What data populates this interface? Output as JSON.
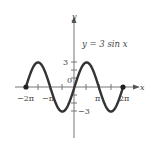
{
  "chart_data": {
    "type": "line",
    "title": "y = 3 sin x",
    "function": "3*sin(x)",
    "series": [
      {
        "name": "y = 3 sin x",
        "x": [
          "-2π",
          "-3π/2",
          "-π",
          "-π/2",
          "0",
          "π/2",
          "π",
          "3π/2",
          "2π"
        ],
        "values": [
          0,
          3,
          0,
          -3,
          0,
          3,
          0,
          -3,
          0
        ]
      }
    ],
    "xlabel": "x",
    "ylabel": "y",
    "x_tick_labels": [
      "-2π",
      "-π",
      "π",
      "2π"
    ],
    "y_tick_labels": [
      "3",
      "-3"
    ],
    "origin_label": "0",
    "xlim": [
      "-2π",
      "2π"
    ],
    "ylim": [
      -3,
      3
    ],
    "endpoints": [
      "(-2π, 0)",
      "(2π, 0)"
    ],
    "grid": false,
    "legend": "none"
  },
  "labels": {
    "equation": "y = 3 sin x",
    "x_axis": "x",
    "y_axis": "y",
    "origin": "0",
    "y_pos": "3",
    "y_neg": "−3",
    "x_neg2pi": "−2π",
    "x_negpi": "−π",
    "x_pi": "π",
    "x_2pi": "2π"
  },
  "colors": {
    "curve": "#333333",
    "axis": "#777777",
    "text": "#444444"
  }
}
